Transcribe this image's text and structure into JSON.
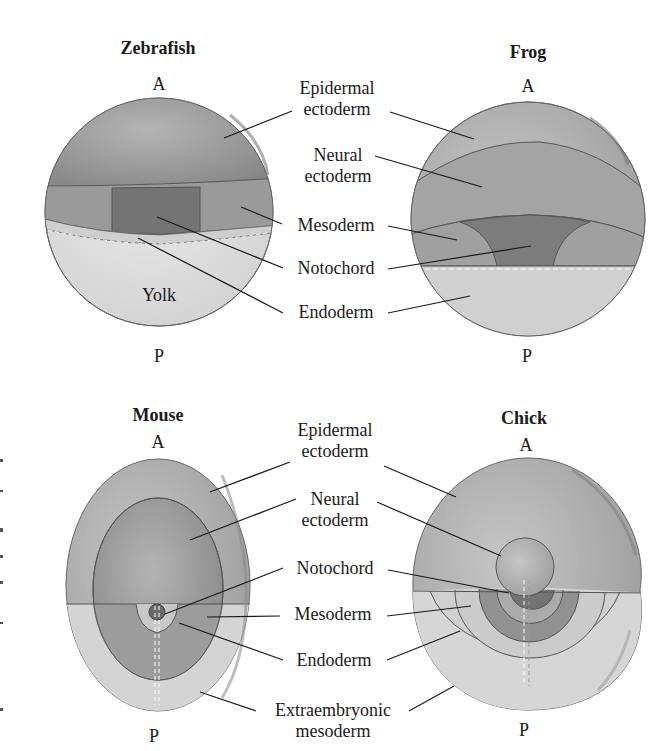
{
  "figure": {
    "panels": [
      {
        "id": "zebrafish",
        "title": "Zebrafish",
        "anterior": "A",
        "posterior": "P",
        "inner_label": "Yolk"
      },
      {
        "id": "frog",
        "title": "Frog",
        "anterior": "A",
        "posterior": "P"
      },
      {
        "id": "mouse",
        "title": "Mouse",
        "anterior": "A",
        "posterior": "P"
      },
      {
        "id": "chick",
        "title": "Chick",
        "anterior": "A",
        "posterior": "P"
      }
    ],
    "top_labels": {
      "epidermal_line1": "Epidermal",
      "epidermal_line2": "ectoderm",
      "neural_line1": "Neural",
      "neural_line2": "ectoderm",
      "mesoderm": "Mesoderm",
      "notochord": "Notochord",
      "endoderm": "Endoderm"
    },
    "bottom_labels": {
      "epidermal_line1": "Epidermal",
      "epidermal_line2": "ectoderm",
      "neural_line1": "Neural",
      "neural_line2": "ectoderm",
      "notochord": "Notochord",
      "mesoderm": "Mesoderm",
      "endoderm": "Endoderm",
      "extraembryonic_line1": "Extraembryonic",
      "extraembryonic_line2": "mesoderm"
    },
    "colors": {
      "epidermal": "#a9a9a9",
      "neural": "#9a9a9a",
      "mesoderm": "#8e8e8e",
      "notochord": "#6f6f6f",
      "endoderm": "#cfcfcf",
      "yolk": "#e2e2e2",
      "extraembryonic": "#d4d4d4",
      "outline": "#555555",
      "leader": "#1a1a1a"
    }
  }
}
